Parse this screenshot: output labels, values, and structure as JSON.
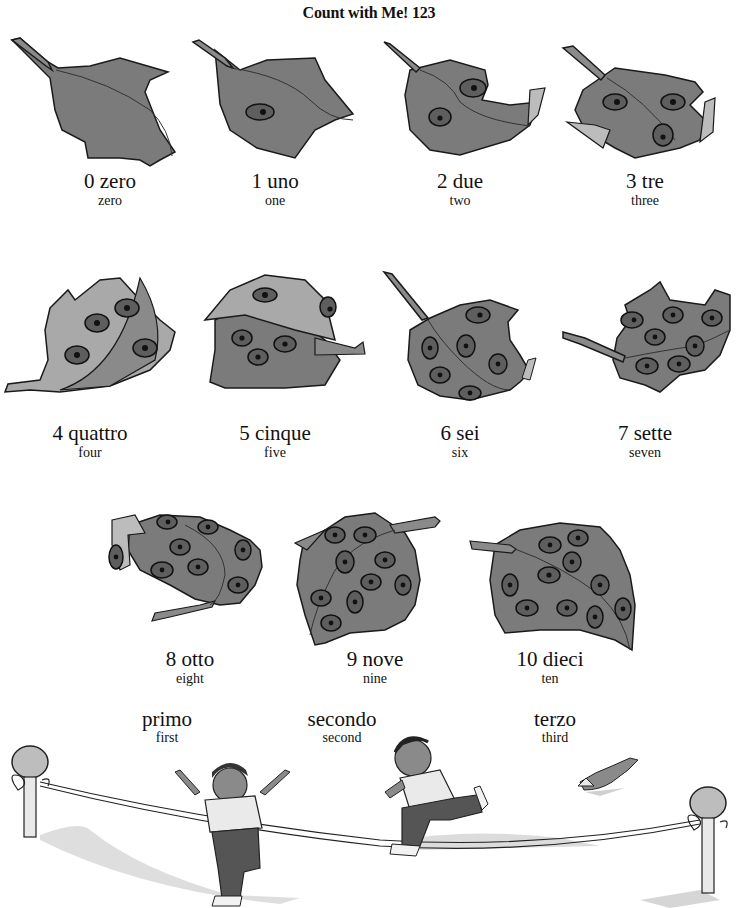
{
  "title": "Count with Me! 123",
  "colors": {
    "leaf": "#7b7b7b",
    "leaf_light": "#a9a9a9",
    "outline": "#1a1a1a",
    "ladybug": "#5e5e5e",
    "background": "#ffffff"
  },
  "numbers": [
    {
      "digit": "0",
      "italian": "0 zero",
      "english": "zero",
      "ladybugs": 0
    },
    {
      "digit": "1",
      "italian": "1 uno",
      "english": "one",
      "ladybugs": 1
    },
    {
      "digit": "2",
      "italian": "2 due",
      "english": "two",
      "ladybugs": 2
    },
    {
      "digit": "3",
      "italian": "3 tre",
      "english": "three",
      "ladybugs": 3
    },
    {
      "digit": "4",
      "italian": "4 quattro",
      "english": "four",
      "ladybugs": 4
    },
    {
      "digit": "5",
      "italian": "5 cinque",
      "english": "five",
      "ladybugs": 5
    },
    {
      "digit": "6",
      "italian": "6 sei",
      "english": "six",
      "ladybugs": 6
    },
    {
      "digit": "7",
      "italian": "7 sette",
      "english": "seven",
      "ladybugs": 7
    },
    {
      "digit": "8",
      "italian": "8 otto",
      "english": "eight",
      "ladybugs": 8
    },
    {
      "digit": "9",
      "italian": "9 nove",
      "english": "nine",
      "ladybugs": 9
    },
    {
      "digit": "10",
      "italian": "10 dieci",
      "english": "ten",
      "ladybugs": 10
    }
  ],
  "ordinals": [
    {
      "italian": "primo",
      "english": "first",
      "figure": "girl-crossing-finish-line"
    },
    {
      "italian": "secondo",
      "english": "second",
      "figure": "boy-running"
    },
    {
      "italian": "terzo",
      "english": "third",
      "figure": "rabbit-leaping"
    }
  ]
}
